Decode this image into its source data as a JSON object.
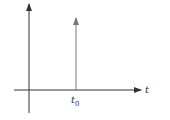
{
  "diagram": {
    "type": "impulse-plot",
    "x_axis_label": "t",
    "impulse_label_main": "t",
    "impulse_label_sub": "0",
    "colors": {
      "axis": "#333333",
      "impulse": "#777777",
      "background": "#ffffff"
    }
  }
}
